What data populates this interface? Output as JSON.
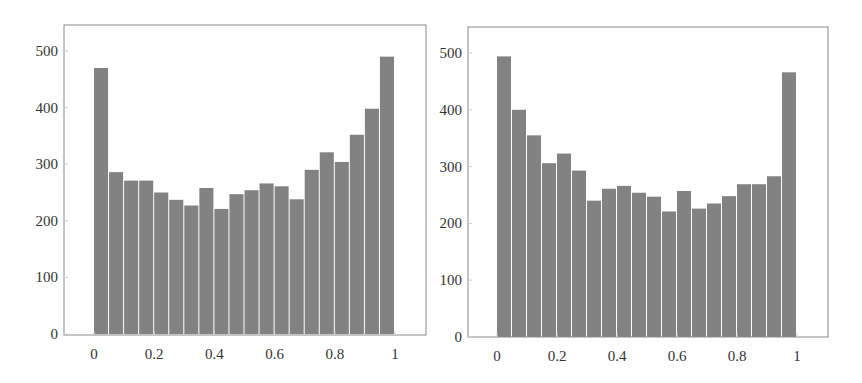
{
  "chart_data": [
    {
      "type": "bar",
      "subtype": "histogram",
      "title": "",
      "xlabel": "",
      "ylabel": "",
      "xlim": [
        -0.09,
        1.1
      ],
      "ylim": [
        0,
        545
      ],
      "grid": false,
      "legend": null,
      "bin_width": 0.05,
      "bin_edges": [
        0,
        0.05,
        0.1,
        0.15,
        0.2,
        0.25,
        0.3,
        0.35,
        0.4,
        0.45,
        0.5,
        0.55,
        0.6,
        0.65,
        0.7,
        0.75,
        0.8,
        0.85,
        0.9,
        0.95,
        1.0
      ],
      "values": [
        470,
        286,
        271,
        271,
        250,
        237,
        227,
        258,
        221,
        247,
        254,
        266,
        261,
        238,
        290,
        321,
        304,
        352,
        398,
        490
      ],
      "xticks": [
        "0",
        "0.2",
        "0.4",
        "0.6",
        "0.8",
        "1"
      ],
      "xtick_values": [
        0,
        0.2,
        0.4,
        0.6,
        0.8,
        1
      ],
      "yticks": [
        "0",
        "100",
        "200",
        "300",
        "400",
        "500"
      ],
      "ytick_values": [
        0,
        100,
        200,
        300,
        400,
        500
      ],
      "bar_color": "#828282"
    },
    {
      "type": "bar",
      "subtype": "histogram",
      "title": "",
      "xlabel": "",
      "ylabel": "",
      "xlim": [
        -0.09,
        1.1
      ],
      "ylim": [
        0,
        545
      ],
      "grid": false,
      "legend": null,
      "bin_width": 0.05,
      "bin_edges": [
        0,
        0.05,
        0.1,
        0.15,
        0.2,
        0.25,
        0.3,
        0.35,
        0.4,
        0.45,
        0.5,
        0.55,
        0.6,
        0.65,
        0.7,
        0.75,
        0.8,
        0.85,
        0.9,
        0.95,
        1.0
      ],
      "values": [
        494,
        400,
        355,
        306,
        323,
        293,
        240,
        261,
        266,
        254,
        247,
        221,
        257,
        226,
        235,
        248,
        269,
        269,
        283,
        466
      ],
      "xticks": [
        "0",
        "0.2",
        "0.4",
        "0.6",
        "0.8",
        "1"
      ],
      "xtick_values": [
        0,
        0.2,
        0.4,
        0.6,
        0.8,
        1
      ],
      "yticks": [
        "0",
        "100",
        "200",
        "300",
        "400",
        "500"
      ],
      "ytick_values": [
        0,
        100,
        200,
        300,
        400,
        500
      ],
      "bar_color": "#828282"
    }
  ],
  "layout": {
    "panels": [
      {
        "left": 64,
        "top": 25,
        "right": 426,
        "bottom": 335,
        "x0_px": 94,
        "x1_px": 395,
        "y0_px": 334,
        "y500_px": 51
      },
      {
        "left": 468,
        "top": 27,
        "right": 828,
        "bottom": 337,
        "x0_px": 497,
        "x1_px": 797,
        "y0_px": 337,
        "y500_px": 53
      }
    ],
    "axis_color": "#8a8a8a",
    "tick_label_color": "#333333"
  }
}
